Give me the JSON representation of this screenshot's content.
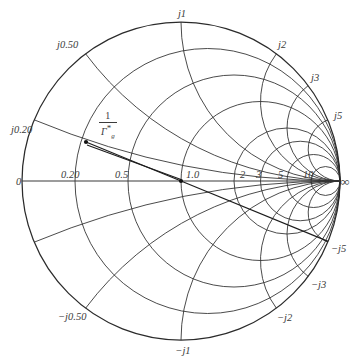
{
  "figure": {
    "title": "",
    "type": "smith-chart",
    "background": "#ffffff",
    "line_color": "#2b2b2b"
  },
  "chart_data": {
    "type": "smith-chart",
    "title": "",
    "xlabel": "",
    "ylabel": "",
    "geometry": {
      "center_px": [
        181,
        181
      ],
      "radius_px": 159,
      "unit_circle": true,
      "grid": true,
      "legend_position": "none"
    },
    "resistance_circles": {
      "label": "constant resistance r",
      "values": [
        0,
        0.2,
        0.5,
        1.0,
        2,
        3,
        5,
        10
      ],
      "tick_labels": [
        "0",
        "0.20",
        "0.5",
        "1.0",
        "2",
        "3",
        "5",
        "10"
      ],
      "infinity_label": "∞"
    },
    "reactance_arcs": {
      "label": "constant reactance x",
      "positive_values": [
        0.2,
        0.5,
        1,
        2,
        3,
        5
      ],
      "positive_tick_labels": [
        "j0.20",
        "j0.50",
        "j1",
        "j2",
        "j3",
        "j5"
      ],
      "negative_values": [
        -0.2,
        -0.5,
        -1,
        -2,
        -3,
        -5
      ],
      "negative_tick_labels": [
        "−j0.20",
        "−j0.50",
        "−j1",
        "−j2",
        "−j3",
        "−j5"
      ],
      "drawn_negative_tick_labels": [
        "−j0.50",
        "−j1",
        "−j2",
        "−j3",
        "−j5"
      ]
    },
    "annotations": [
      {
        "name": "gamma-conjugate-point",
        "numerator": "1",
        "denominator_base": "Γ",
        "denominator_star": "*",
        "denominator_sub": "g",
        "text": "1/Γ*g",
        "point_px": [
          86,
          142
        ],
        "center_px": [
          181,
          181
        ]
      }
    ],
    "axis_labels": {
      "left_origin": "0",
      "right_infinity": "∞"
    }
  },
  "labels": {
    "real_axis": [
      {
        "text": "0",
        "x": 16,
        "y": 185,
        "anchor": "start",
        "italic": false
      },
      {
        "text": "0.20",
        "x": 61,
        "y": 178,
        "anchor": "start",
        "italic": false
      },
      {
        "text": "0.5",
        "x": 115,
        "y": 178,
        "anchor": "start",
        "italic": false
      },
      {
        "text": "1.0",
        "x": 186,
        "y": 178,
        "anchor": "start",
        "italic": false
      },
      {
        "text": "2",
        "x": 240,
        "y": 178,
        "anchor": "start",
        "italic": false
      },
      {
        "text": "3",
        "x": 256,
        "y": 178,
        "anchor": "start",
        "italic": false
      },
      {
        "text": "5",
        "x": 278,
        "y": 178,
        "anchor": "start",
        "italic": false
      },
      {
        "text": "10",
        "x": 303,
        "y": 178,
        "anchor": "start",
        "italic": false
      },
      {
        "text": "∞",
        "x": 345,
        "y": 186,
        "anchor": "middle",
        "italic": false
      }
    ],
    "reactance_positive": [
      {
        "text": "j0.20",
        "x": 11,
        "y": 133,
        "anchor": "start",
        "italic": true
      },
      {
        "text": "j0.50",
        "x": 57,
        "y": 48,
        "anchor": "start",
        "italic": true
      },
      {
        "text": "j1",
        "x": 182,
        "y": 17,
        "anchor": "middle",
        "italic": true
      },
      {
        "text": "j2",
        "x": 278,
        "y": 48,
        "anchor": "start",
        "italic": true
      },
      {
        "text": "j3",
        "x": 311,
        "y": 81,
        "anchor": "start",
        "italic": true
      },
      {
        "text": "j5",
        "x": 334,
        "y": 119,
        "anchor": "start",
        "italic": true
      }
    ],
    "reactance_negative": [
      {
        "text": "−j5",
        "x": 331,
        "y": 252,
        "anchor": "start",
        "italic": true
      },
      {
        "text": "−j3",
        "x": 311,
        "y": 288,
        "anchor": "start",
        "italic": true
      },
      {
        "text": "−j2",
        "x": 277,
        "y": 321,
        "anchor": "start",
        "italic": true
      },
      {
        "text": "−j1",
        "x": 183,
        "y": 354,
        "anchor": "middle",
        "italic": true
      },
      {
        "text": "−j0.50",
        "x": 58,
        "y": 320,
        "anchor": "start",
        "italic": true
      }
    ]
  }
}
